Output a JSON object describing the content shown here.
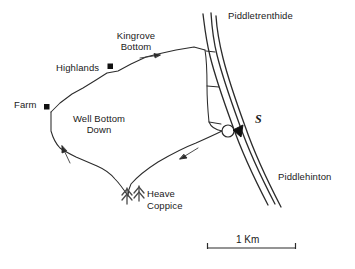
{
  "map": {
    "title": "Well Bottom Down area map",
    "background_color": "#ffffff",
    "line_color": "#2b2b2b",
    "text_color": "#1a1a1a",
    "places": [
      {
        "id": "piddletrenthide",
        "label": "Piddletrenthide",
        "x": 228,
        "y": 11,
        "type": "settlement-label"
      },
      {
        "id": "kingrove-bottom",
        "label": "Kingrove Bottom",
        "line1": "Kingrove",
        "line2": "Bottom",
        "x": 108,
        "y": 31,
        "type": "valley-label"
      },
      {
        "id": "highlands",
        "label": "Highlands",
        "x": 57,
        "y": 64,
        "type": "farm-label"
      },
      {
        "id": "farm",
        "label": "Farm",
        "x": 14,
        "y": 101,
        "type": "farm-label"
      },
      {
        "id": "well-bottom-down",
        "label": "Well Bottom Down",
        "line1": "Well Bottom",
        "line2": "Down",
        "x": 64,
        "y": 114,
        "type": "area-label"
      },
      {
        "id": "heave-coppice",
        "label": "Heave Coppice",
        "line1": "Heave",
        "line2": "Coppice",
        "x": 147,
        "y": 188,
        "type": "woodland-label"
      },
      {
        "id": "piddlehinton",
        "label": "Piddlehinton",
        "x": 278,
        "y": 172,
        "type": "settlement-label"
      },
      {
        "id": "site-s",
        "label": "S",
        "x": 255,
        "y": 117,
        "type": "site-marker-label"
      }
    ],
    "markers": [
      {
        "id": "highlands-marker",
        "shape": "filled-square",
        "x": 110,
        "y": 66,
        "size": 5
      },
      {
        "id": "farm-marker",
        "shape": "filled-square",
        "x": 46,
        "y": 103,
        "size": 5
      },
      {
        "id": "site-circle",
        "shape": "hollow-circle",
        "cx": 228,
        "cy": 131,
        "r": 6
      },
      {
        "id": "site-arrow",
        "shape": "filled-triangle",
        "x": 236,
        "y": 131
      }
    ],
    "trees": [
      {
        "id": "tree-left",
        "x": 127,
        "y": 197
      },
      {
        "id": "tree-right",
        "x": 139,
        "y": 194
      }
    ],
    "direction_arrows": [
      {
        "id": "arrow-kingrove",
        "direction": "east",
        "x": 152,
        "y": 56
      },
      {
        "id": "arrow-south-west",
        "direction": "south-west",
        "x": 184,
        "y": 157
      },
      {
        "id": "arrow-north-west",
        "direction": "north",
        "x": 64,
        "y": 152
      }
    ],
    "scale_bar": {
      "label": "1 Km",
      "x_start": 207,
      "x_end": 296,
      "y": 248,
      "tick_height": 6
    }
  }
}
